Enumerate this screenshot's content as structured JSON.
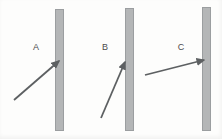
{
  "figure": {
    "background_color": "#fdfdfc",
    "bar_fill_color": "#b4b6b7",
    "bar_border_color": "#9b9ea0",
    "arrow_color": "#5d6062",
    "label_color": "#4c4c4c",
    "panels": [
      {
        "label": "A",
        "label_x": 36,
        "label_y": 50,
        "bar": {
          "x": 55.5,
          "y": 9,
          "width": 8,
          "height": 121
        },
        "arrow": {
          "x1": 14,
          "y1": 100,
          "x2": 59,
          "y2": 61
        }
      },
      {
        "label": "B",
        "label_x": 105,
        "label_y": 50,
        "bar": {
          "x": 125,
          "y": 8,
          "width": 8,
          "height": 122
        },
        "arrow": {
          "x1": 101,
          "y1": 118,
          "x2": 125,
          "y2": 62
        }
      },
      {
        "label": "C",
        "label_x": 181,
        "label_y": 50,
        "bar": {
          "x": 202,
          "y": 7,
          "width": 8,
          "height": 123
        },
        "arrow": {
          "x1": 145,
          "y1": 75,
          "x2": 204,
          "y2": 60
        }
      }
    ]
  }
}
